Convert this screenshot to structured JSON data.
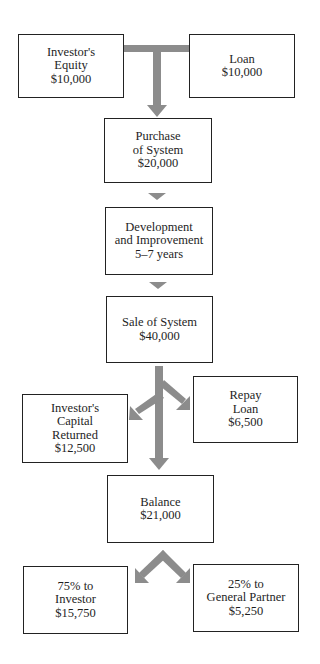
{
  "diagram": {
    "type": "flowchart",
    "arrow_color": "#8c8c8c",
    "nodes": {
      "equity": {
        "lines": [
          "Investor's",
          "Equity",
          "$10,000"
        ]
      },
      "loan": {
        "lines": [
          "Loan",
          "$10,000"
        ]
      },
      "purchase": {
        "lines": [
          "Purchase",
          "of System",
          "$20,000"
        ]
      },
      "development": {
        "lines": [
          "Development",
          "and Improvement",
          "5–7 years"
        ]
      },
      "sale": {
        "lines": [
          "Sale of System",
          "$40,000"
        ]
      },
      "capital_returned": {
        "lines": [
          "Investor's",
          "Capital",
          "Returned",
          "$12,500"
        ]
      },
      "repay_loan": {
        "lines": [
          "Repay",
          "Loan",
          "$6,500"
        ]
      },
      "balance": {
        "lines": [
          "Balance",
          "$21,000"
        ]
      },
      "investor_share": {
        "lines": [
          "75% to",
          "Investor",
          "$15,750"
        ]
      },
      "partner_share": {
        "lines": [
          "25% to",
          "General Partner",
          "$5,250"
        ]
      }
    },
    "edges": [
      [
        "equity",
        "purchase"
      ],
      [
        "loan",
        "purchase"
      ],
      [
        "purchase",
        "development"
      ],
      [
        "development",
        "sale"
      ],
      [
        "sale",
        "capital_returned"
      ],
      [
        "sale",
        "repay_loan"
      ],
      [
        "sale",
        "balance"
      ],
      [
        "balance",
        "investor_share"
      ],
      [
        "balance",
        "partner_share"
      ]
    ]
  }
}
